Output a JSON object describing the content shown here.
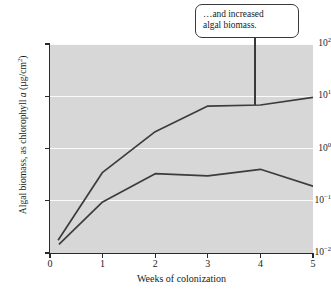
{
  "figure": {
    "background": "#ffffff",
    "plot_background": "#d7d7d7",
    "gridline_color": "#fafafa",
    "axis_color": "#2a2a2a",
    "line_color": "#3c3c3c"
  },
  "callout": {
    "line1": "…and increased",
    "line2": "algal biomass.",
    "leader_target_week": 3.9,
    "border_color": "#3a3a3a",
    "fill_color": "#ffffff"
  },
  "chart_data": {
    "type": "line",
    "title": "",
    "xlabel": "Weeks of colonization",
    "ylabel": "Algal biomass, as chlorophyll a (µg/cm²)",
    "ylabel_parts": {
      "prefix": "Algal biomass, as chlorophyll ",
      "italic": "a",
      "suffix_open": " (µg/cm",
      "superscript": "2",
      "suffix_close": ")"
    },
    "yscale": "log",
    "ylim": [
      0.01,
      100
    ],
    "xlim": [
      0,
      5
    ],
    "xticks": [
      0,
      1,
      2,
      3,
      4,
      5
    ],
    "xtick_labels": [
      "0",
      "1",
      "2",
      "3",
      "4",
      "5"
    ],
    "yticks": [
      0.01,
      0.1,
      1,
      10,
      100
    ],
    "ytick_labels": [
      {
        "mantissa": "10",
        "exponent": "−2"
      },
      {
        "mantissa": "10",
        "exponent": "−1"
      },
      {
        "mantissa": "10",
        "exponent": "0"
      },
      {
        "mantissa": "10",
        "exponent": "1"
      },
      {
        "mantissa": "10",
        "exponent": "2"
      }
    ],
    "grid": true,
    "grid_axis": "y",
    "legend": false,
    "series": [
      {
        "name": "upper-curve",
        "x": [
          0.16,
          1.0,
          2.0,
          3.0,
          4.0,
          5.0
        ],
        "values": [
          0.018,
          0.35,
          2.1,
          6.5,
          6.8,
          9.5
        ]
      },
      {
        "name": "lower-curve",
        "x": [
          0.18,
          1.0,
          2.0,
          3.0,
          4.0,
          5.0
        ],
        "values": [
          0.015,
          0.095,
          0.33,
          0.3,
          0.4,
          0.19
        ]
      }
    ]
  }
}
